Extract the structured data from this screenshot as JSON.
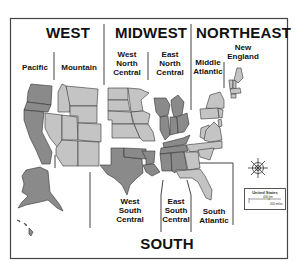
{
  "map": {
    "title": "United States Census Regions and Divisions",
    "regions": [
      {
        "name": "WEST",
        "divisions": [
          "Pacific",
          "Mountain"
        ]
      },
      {
        "name": "MIDWEST",
        "divisions": [
          "West North Central",
          "East North Central"
        ]
      },
      {
        "name": "NORTHEAST",
        "divisions": [
          "Middle Atlantic",
          "New England"
        ]
      },
      {
        "name": "SOUTH",
        "divisions": [
          "West South Central",
          "East South Central",
          "South Atlantic"
        ]
      }
    ],
    "labels": {
      "west": "WEST",
      "midwest": "MIDWEST",
      "northeast": "NORTHEAST",
      "south": "SOUTH",
      "pacific": "Pacific",
      "mountain": "Mountain",
      "west_north_central": "West\nNorth\nCentral",
      "east_north_central": "East\nNorth\nCentral",
      "middle_atlantic": "Middle\nAtlantic",
      "new_england": "New\nEngland",
      "west_south_central": "West\nSouth\nCentral",
      "east_south_central": "East\nSouth\nCentral",
      "south_atlantic": "South\nAtlantic"
    },
    "legend": {
      "title": "United States",
      "scale_top": "400 km",
      "scale_bottom": "400 miles",
      "scale_zero": "0"
    },
    "colors": {
      "dark_fill": "#8a8a8a",
      "light_fill": "#c4c4c4",
      "stroke": "#333333",
      "frame": "#444444"
    },
    "compass_icon": "compass-rose"
  }
}
